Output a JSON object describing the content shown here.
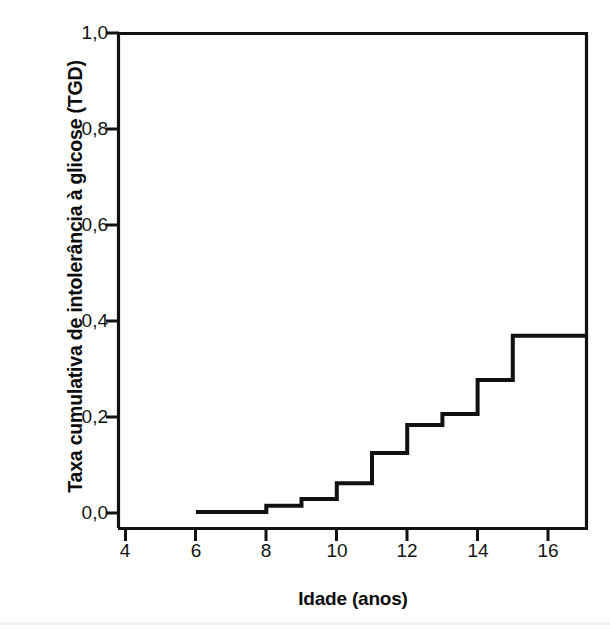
{
  "figure": {
    "background_color": "#ffffff",
    "ink_color": "#111111"
  },
  "axes": {
    "y_title": "Taxa cumulativa de intolerância à glicose (TGD)",
    "x_title": "Idade (anos)",
    "y_tick_labels": [
      "1,0",
      "0,8",
      "0,6",
      "0,4",
      "0,2",
      "0,0"
    ],
    "x_tick_labels": [
      "4",
      "6",
      "8",
      "10",
      "12",
      "14",
      "16"
    ]
  },
  "chart_data": {
    "type": "line",
    "subtype": "step-post",
    "title": "",
    "subtitle": "",
    "xlabel": "Idade (anos)",
    "ylabel": "Taxa cumulativa de intolerância à glicose (TGD)",
    "xlim": [
      4,
      17.1
    ],
    "ylim": [
      0.0,
      1.0
    ],
    "xticks": [
      4,
      6,
      8,
      10,
      12,
      14,
      16
    ],
    "yticks": [
      0.0,
      0.2,
      0.4,
      0.6,
      0.8,
      1.0
    ],
    "ytick_labels": [
      "0,0",
      "0,2",
      "0,4",
      "0,6",
      "0,8",
      "1,0"
    ],
    "xtick_labels": [
      "4",
      "6",
      "8",
      "10",
      "12",
      "14",
      "16"
    ],
    "grid": false,
    "legend": null,
    "decimal_separator": ",",
    "line_color": "#111111",
    "line_width_px": 4,
    "series": [
      {
        "name": "Taxa cumulativa de intolerância à glicose (TGD)",
        "x": [
          6,
          8,
          9,
          10,
          11,
          12,
          13,
          14,
          15,
          17.1
        ],
        "y": [
          0.0,
          0.013,
          0.027,
          0.06,
          0.123,
          0.181,
          0.204,
          0.275,
          0.367,
          0.367
        ]
      }
    ],
    "steps": [
      {
        "x_start": 6,
        "x_end": 8,
        "value": 0.0
      },
      {
        "x_start": 8,
        "x_end": 9,
        "value": 0.013
      },
      {
        "x_start": 9,
        "x_end": 10,
        "value": 0.027
      },
      {
        "x_start": 10,
        "x_end": 11,
        "value": 0.06
      },
      {
        "x_start": 11,
        "x_end": 12,
        "value": 0.123
      },
      {
        "x_start": 12,
        "x_end": 13,
        "value": 0.181
      },
      {
        "x_start": 13,
        "x_end": 14,
        "value": 0.204
      },
      {
        "x_start": 14,
        "x_end": 15,
        "value": 0.275
      },
      {
        "x_start": 15,
        "x_end": 17.1,
        "value": 0.367
      }
    ],
    "annotations": []
  }
}
